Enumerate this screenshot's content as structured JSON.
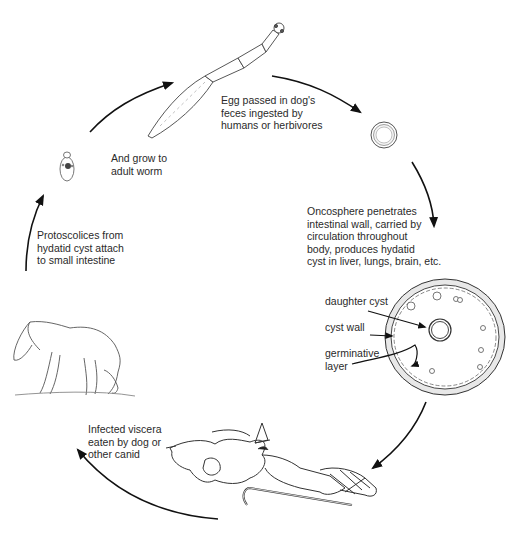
{
  "diagram": {
    "type": "life-cycle",
    "stages": [
      {
        "id": "adult-worm",
        "caption": "And grow to\nadult worm"
      },
      {
        "id": "egg",
        "caption": "Egg passed in dog's\nfeces ingested by\nhumans or herbivores"
      },
      {
        "id": "oncosphere",
        "caption": "Oncosphere penetrates\nintestinal wall, carried by\ncirculation throughout\nbody, produces hydatid\ncyst in liver, lungs, brain, etc."
      },
      {
        "id": "viscera",
        "caption": "Infected viscera\neaten by dog or\nother canid"
      },
      {
        "id": "protoscolices",
        "caption": "Protoscolices from\nhydatid cyst attach\nto small intestine"
      }
    ],
    "cyst_labels": {
      "daughter_cyst": "daughter cyst",
      "cyst_wall": "cyst wall",
      "germinative_layer": "germinative\nlayer"
    }
  }
}
